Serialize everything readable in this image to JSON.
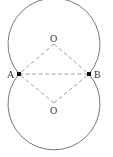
{
  "diagram": {
    "labels": {
      "point_a": "A",
      "point_b": "B",
      "center_top": "O",
      "center_bottom": "O"
    },
    "colors": {
      "stroke": "#555555",
      "dash": "#888888",
      "point": "#111111"
    }
  }
}
